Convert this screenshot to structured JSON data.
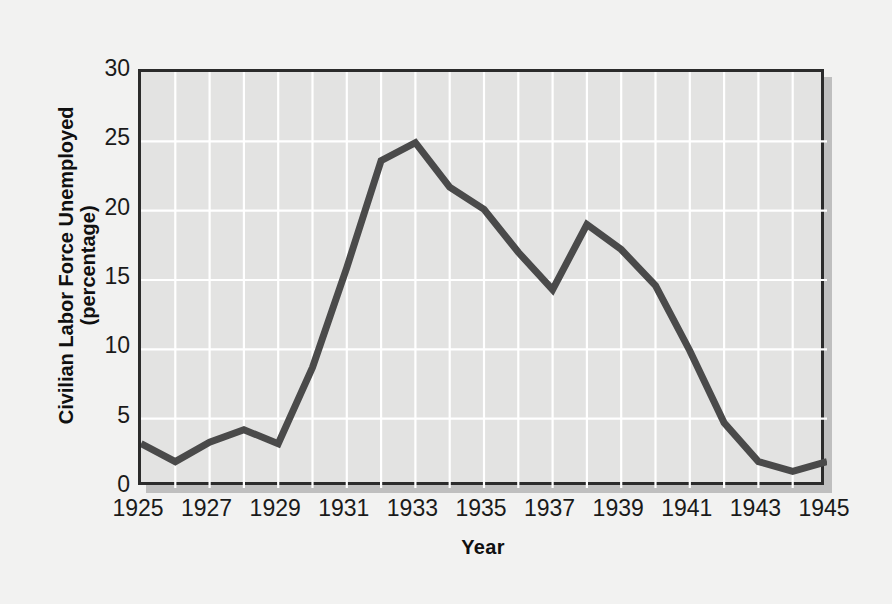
{
  "chart_data": {
    "type": "line",
    "title": "",
    "xlabel": "Year",
    "ylabel": "Civilian Labor Force Unemployed (percentage)",
    "ylabel_line1": "Civilian Labor Force Unemployed",
    "ylabel_line2": "(percentage)",
    "xlim": [
      1925,
      1945
    ],
    "ylim": [
      0,
      30
    ],
    "grid": true,
    "legend": "none",
    "xticks": [
      1925,
      1927,
      1929,
      1931,
      1933,
      1935,
      1937,
      1939,
      1941,
      1943,
      1945
    ],
    "xtick_labels": [
      "1925",
      "1927",
      "1929",
      "1931",
      "1933",
      "1935",
      "1937",
      "1939",
      "1941",
      "1943",
      "1945"
    ],
    "yticks": [
      0,
      5,
      10,
      15,
      20,
      25,
      30
    ],
    "ytick_labels": [
      "0",
      "5",
      "10",
      "15",
      "20",
      "25",
      "30"
    ],
    "x": [
      1925,
      1926,
      1927,
      1928,
      1929,
      1930,
      1931,
      1932,
      1933,
      1934,
      1935,
      1936,
      1937,
      1938,
      1939,
      1940,
      1941,
      1942,
      1943,
      1944,
      1945
    ],
    "values": [
      3.2,
      1.9,
      3.3,
      4.2,
      3.2,
      8.7,
      15.9,
      23.6,
      24.9,
      21.7,
      20.1,
      17.0,
      14.3,
      19.0,
      17.2,
      14.6,
      9.9,
      4.7,
      1.9,
      1.2,
      1.9
    ],
    "series": [
      {
        "name": "Civilian Labor Force Unemployed",
        "color": "#4a4a4a",
        "values": [
          3.2,
          1.9,
          3.3,
          4.2,
          3.2,
          8.7,
          15.9,
          23.6,
          24.9,
          21.7,
          20.1,
          17.0,
          14.3,
          19.0,
          17.2,
          14.6,
          9.9,
          4.7,
          1.9,
          1.2,
          1.9
        ]
      }
    ],
    "colors": {
      "background": "#f2f2f1",
      "plot_background": "#e3e3e2",
      "gridline": "#ffffff",
      "axis": "#2b2b2b",
      "line": "#4a4a4a",
      "shadow": "#bfbfbf"
    }
  }
}
